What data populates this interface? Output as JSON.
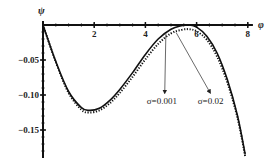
{
  "chart_data": {
    "type": "line",
    "title": "",
    "xlabel": "φ",
    "ylabel": "ψ",
    "xlim": [
      0,
      8.2
    ],
    "ylim": [
      -0.19,
      0.0
    ],
    "grid": false,
    "legend": "none (inline annotations with arrows)",
    "x_ticks": [
      2,
      4,
      6,
      8
    ],
    "x_tick_labels": [
      "2",
      "4",
      "6",
      "8"
    ],
    "y_ticks": [
      -0.05,
      -0.1,
      -0.15
    ],
    "y_tick_labels": [
      "-0.05",
      "-0.10",
      "-0.15"
    ],
    "series": [
      {
        "name": "σ=0.02",
        "style": "solid",
        "x": [
          0,
          0.5,
          1.0,
          1.5,
          1.8,
          2.2,
          2.6,
          3.0,
          3.5,
          4.0,
          4.5,
          5.0,
          5.4,
          5.7,
          6.0,
          6.4,
          6.8,
          7.2,
          7.6,
          7.9
        ],
        "y": [
          0,
          -0.052,
          -0.095,
          -0.118,
          -0.122,
          -0.119,
          -0.108,
          -0.092,
          -0.068,
          -0.042,
          -0.02,
          -0.006,
          -0.001,
          0.0,
          -0.003,
          -0.016,
          -0.04,
          -0.078,
          -0.13,
          -0.185
        ]
      },
      {
        "name": "σ=0.001",
        "style": "dotted",
        "x": [
          0,
          0.5,
          1.0,
          1.5,
          1.8,
          2.2,
          2.6,
          3.0,
          3.5,
          4.0,
          4.5,
          5.0,
          5.4,
          5.7,
          6.0,
          6.4,
          6.8,
          7.2,
          7.6,
          7.9
        ],
        "y": [
          0,
          -0.053,
          -0.097,
          -0.121,
          -0.125,
          -0.122,
          -0.112,
          -0.097,
          -0.074,
          -0.049,
          -0.027,
          -0.012,
          -0.007,
          -0.006,
          -0.009,
          -0.021,
          -0.045,
          -0.082,
          -0.133,
          -0.188
        ]
      }
    ],
    "annotations": [
      {
        "text": "σ=0.001",
        "arrow_from": [
          4.8,
          -0.006
        ],
        "text_at": [
          4.6,
          -0.12
        ]
      },
      {
        "text": "σ=0.02",
        "arrow_from": [
          5.2,
          -0.005
        ],
        "text_at": [
          6.2,
          -0.12
        ]
      }
    ]
  }
}
